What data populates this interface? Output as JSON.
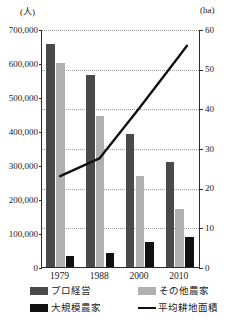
{
  "chart_data": {
    "type": "bar",
    "title": "",
    "subtitle": "",
    "xlabel": "",
    "ylabel": "(人)",
    "y2label": "(ha)",
    "categories": [
      "1979",
      "1988",
      "2000",
      "2010"
    ],
    "grid": true,
    "legend_position": "bottom",
    "ylim": [
      0,
      700000
    ],
    "y2lim": [
      0,
      60
    ],
    "yticks": [
      "0",
      "100,000",
      "200,000",
      "300,000",
      "400,000",
      "500,000",
      "600,000",
      "700,000"
    ],
    "ytick_values": [
      0,
      100000,
      200000,
      300000,
      400000,
      500000,
      600000,
      700000
    ],
    "y2ticks": [
      "0",
      "10",
      "20",
      "30",
      "40",
      "50",
      "60"
    ],
    "y2tick_values": [
      0,
      10,
      20,
      30,
      40,
      50,
      60
    ],
    "series": [
      {
        "name": "プロ経営",
        "kind": "bar",
        "axis": "left",
        "color": "#4a4a4a",
        "values": [
          655000,
          565000,
          390000,
          310000
        ]
      },
      {
        "name": "その他農家",
        "kind": "bar",
        "axis": "left",
        "color": "#b0b0b0",
        "values": [
          600000,
          443000,
          268000,
          172000
        ]
      },
      {
        "name": "大規模農家",
        "kind": "bar",
        "axis": "left",
        "color": "#111111",
        "values": [
          32000,
          41000,
          74000,
          88000
        ]
      },
      {
        "name": "平均耕地面積",
        "kind": "line",
        "axis": "right",
        "color": "#111111",
        "values": [
          23.0,
          27.5,
          40.0,
          53.0
        ],
        "extension_value": 56.0
      }
    ]
  },
  "axes": {
    "left_unit": "(人)",
    "right_unit": "(ha)"
  },
  "legend": {
    "items": [
      {
        "label": "プロ経営",
        "swatch": "dark-gray-square"
      },
      {
        "label": "その他農家",
        "swatch": "light-gray-square"
      },
      {
        "label": "大規模農家",
        "swatch": "black-square"
      },
      {
        "label": "平均耕地面積",
        "swatch": "black-line"
      }
    ]
  }
}
